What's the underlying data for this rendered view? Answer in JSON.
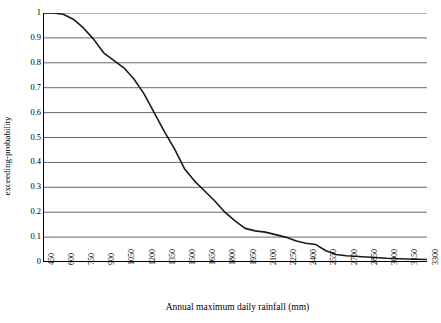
{
  "chart_data": {
    "type": "line",
    "title": "",
    "xlabel": "Annual maximum daily rainfall (mm)",
    "ylabel": "exceeding-probability",
    "xlim": [
      450,
      3300
    ],
    "ylim": [
      0,
      1
    ],
    "grid": true,
    "legend": "none",
    "x_ticks": [
      "450",
      "600",
      "750",
      "900",
      "1050",
      "1200",
      "1350",
      "1500",
      "1650",
      "1800",
      "1950",
      "2100",
      "2250",
      "2400",
      "2550",
      "2700",
      "2850",
      "3000",
      "3150",
      "3300"
    ],
    "y_ticks": [
      "0",
      "0.1",
      "0.2",
      "0.3",
      "0.4",
      "0.5",
      "0.6",
      "0.7",
      "0.8",
      "0.9",
      "1"
    ],
    "series": [
      {
        "name": "exceeding-probability",
        "color": "#1a1a1a",
        "x": [
          450,
          525,
          600,
          675,
          750,
          825,
          900,
          975,
          1050,
          1125,
          1200,
          1275,
          1350,
          1425,
          1500,
          1575,
          1650,
          1725,
          1800,
          1875,
          1950,
          2025,
          2100,
          2175,
          2250,
          2325,
          2400,
          2475,
          2550,
          2625,
          2700,
          2850,
          3000,
          3150,
          3300
        ],
        "y": [
          1.0,
          1.0,
          0.995,
          0.975,
          0.94,
          0.895,
          0.84,
          0.81,
          0.78,
          0.735,
          0.675,
          0.6,
          0.525,
          0.455,
          0.375,
          0.325,
          0.285,
          0.245,
          0.2,
          0.165,
          0.135,
          0.125,
          0.12,
          0.11,
          0.1,
          0.085,
          0.075,
          0.07,
          0.045,
          0.03,
          0.025,
          0.02,
          0.015,
          0.012,
          0.01
        ]
      }
    ]
  }
}
